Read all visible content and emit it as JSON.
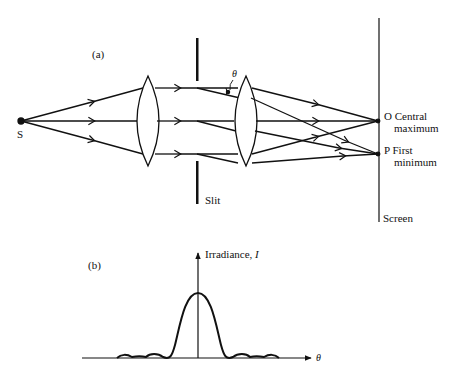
{
  "figure_a": {
    "panel_label": "(a)",
    "source_label": "S",
    "angle_label": "θ",
    "slit_label": "Slit",
    "screen_label": "Screen",
    "point_o": {
      "letter": "O",
      "line1": "Central",
      "line2": "maximum"
    },
    "point_p": {
      "letter": "P",
      "line1": "First",
      "line2": "minimum"
    }
  },
  "figure_b": {
    "panel_label": "(b)",
    "y_axis_label": "Irradiance, ",
    "y_axis_symbol": "I",
    "x_axis_symbol": "θ",
    "curve": "single-slit diffraction pattern: tall central maximum with two smaller secondary maxima on each side"
  },
  "colors": {
    "ink": "#111111",
    "background": "#ffffff"
  }
}
